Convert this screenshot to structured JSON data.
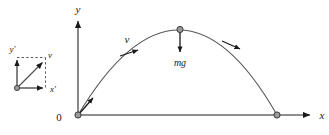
{
  "figure": {
    "type": "projectile-motion-diagram",
    "background_color": "#ffffff",
    "stroke_color": "#4a4a4a",
    "curve_color": "#555555",
    "marker_fill": "#9a9a9a",
    "marker_stroke": "#3a3a3a",
    "arrow_color": "#1a1a1a"
  },
  "main_plot": {
    "origin_label": "0",
    "x_axis_label": "x",
    "y_axis_label": "y",
    "origin_px": {
      "x": 78,
      "y": 115
    },
    "x_axis_end_px": {
      "x": 316,
      "y": 115
    },
    "y_axis_end_px": {
      "x": 78,
      "y": 17
    },
    "trajectory": {
      "launch_px": {
        "x": 78,
        "y": 115
      },
      "apex_px": {
        "x": 180,
        "y": 30
      },
      "landing_px": {
        "x": 277,
        "y": 115
      }
    },
    "markers": [
      {
        "name": "launch-point",
        "x": 78,
        "y": 115
      },
      {
        "name": "apex-point",
        "x": 180,
        "y": 30
      },
      {
        "name": "landing-point",
        "x": 277,
        "y": 115
      }
    ],
    "velocity_label": "v",
    "force_label": "mg"
  },
  "inset": {
    "origin_label": "",
    "x_component_label": "x′",
    "y_component_label": "y′",
    "vector_label": "v",
    "origin_px": {
      "x": 17,
      "y": 88
    },
    "x_tip_px": {
      "x": 48,
      "y": 88
    },
    "y_tip_px": {
      "x": 17,
      "y": 57
    },
    "v_tip_px": {
      "x": 45,
      "y": 60
    }
  }
}
